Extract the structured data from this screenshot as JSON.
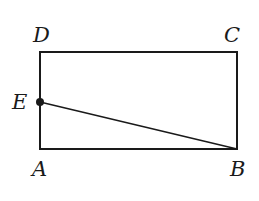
{
  "diagram": {
    "type": "rectangle-with-segment",
    "points": {
      "A": {
        "label": "A",
        "x": 40,
        "y": 149
      },
      "B": {
        "label": "B",
        "x": 237,
        "y": 149
      },
      "C": {
        "label": "C",
        "x": 237,
        "y": 52
      },
      "D": {
        "label": "D",
        "x": 40,
        "y": 52
      },
      "E": {
        "label": "E",
        "x": 40,
        "y": 102
      }
    },
    "segments": [
      "AB",
      "BC",
      "CD",
      "DA",
      "EB"
    ],
    "marked_points": [
      "E"
    ],
    "stroke_color": "#1a1a1a"
  }
}
